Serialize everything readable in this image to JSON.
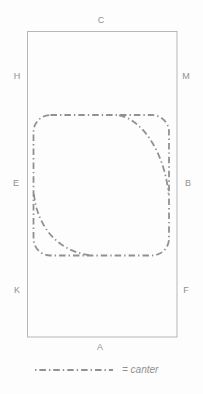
{
  "figure": {
    "background": "#fdfdfd"
  },
  "arena": {
    "border_color": "#b4b7b9",
    "letters": [
      {
        "label": "C",
        "position": "top-center"
      },
      {
        "label": "H",
        "position": "left-top"
      },
      {
        "label": "M",
        "position": "right-top"
      },
      {
        "label": "E",
        "position": "left-middle"
      },
      {
        "label": "B",
        "position": "right-middle"
      },
      {
        "label": "K",
        "position": "left-bottom"
      },
      {
        "label": "F",
        "position": "right-bottom"
      },
      {
        "label": "A",
        "position": "bottom-center"
      }
    ]
  },
  "canter_path": {
    "line_color": "#8f9295",
    "line_style": "dash-dot",
    "shape": "rounded square track with diagonal corner cuts at top-right and bottom-left"
  },
  "legend": {
    "label": "= canter"
  }
}
